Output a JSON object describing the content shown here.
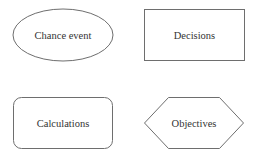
{
  "diagram": {
    "shapes": [
      {
        "id": "chance-event",
        "shape": "ellipse",
        "label": "Chance event"
      },
      {
        "id": "decisions",
        "shape": "rectangle",
        "label": "Decisions"
      },
      {
        "id": "calculations",
        "shape": "rounded-rectangle",
        "label": "Calculations"
      },
      {
        "id": "objectives",
        "shape": "hexagon",
        "label": "Objectives"
      }
    ],
    "colors": {
      "stroke": "#6e6e6e",
      "text": "#333333",
      "background": "#ffffff"
    }
  }
}
